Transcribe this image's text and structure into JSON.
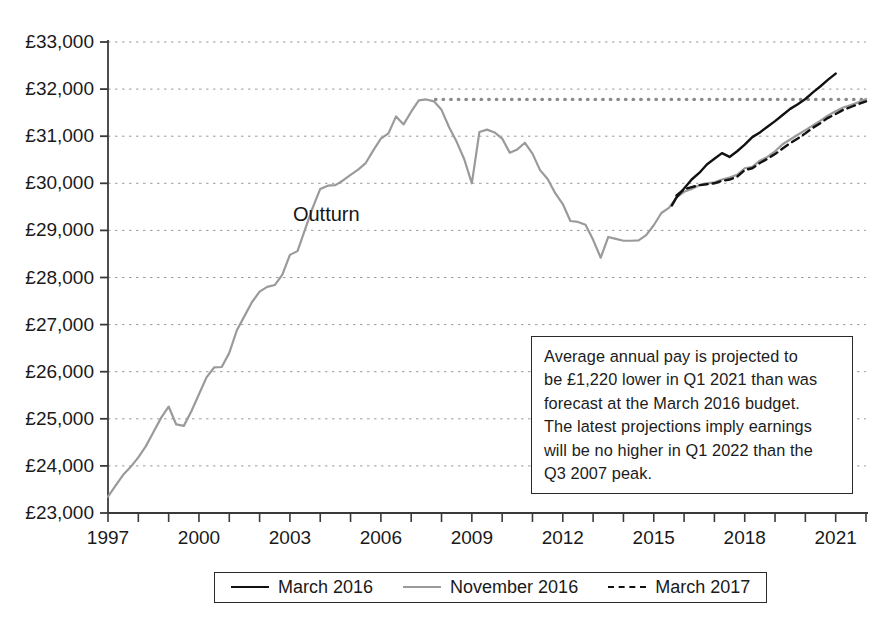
{
  "chart_data": {
    "type": "line",
    "title": "",
    "xlabel": "",
    "ylabel": "",
    "xlim": [
      1997.0,
      2022.0
    ],
    "ylim": [
      23000,
      33000
    ],
    "grid": true,
    "y_tick_labels": [
      "£33,000",
      "£32,000",
      "£31,000",
      "£30,000",
      "£29,000",
      "£28,000",
      "£27,000",
      "£26,000",
      "£25,000",
      "£24,000",
      "£23,000"
    ],
    "y_tick_values": [
      33000,
      32000,
      31000,
      30000,
      29000,
      28000,
      27000,
      26000,
      25000,
      24000,
      23000
    ],
    "x_tick_labels": [
      "1997",
      "2000",
      "2003",
      "2006",
      "2009",
      "2012",
      "2015",
      "2018",
      "2021"
    ],
    "x_tick_values": [
      1997,
      2000,
      2003,
      2006,
      2009,
      2012,
      2015,
      2018,
      2021
    ],
    "x_minor_tick_interval": 1,
    "annotations": [
      {
        "name": "outturn",
        "text": "Outturn",
        "x": 2003.1,
        "y": 29200
      },
      {
        "name": "q3-2007-peak-reference-line",
        "text": "",
        "y": 31780,
        "x_start": 2007.8,
        "x_end": 2022.0,
        "style": "dotted"
      }
    ],
    "legend": {
      "position": "bottom",
      "entries": [
        {
          "label": "March 2016",
          "style": "solid",
          "color": "#111111"
        },
        {
          "label": "November 2016",
          "style": "solid",
          "color": "#9a9a9a"
        },
        {
          "label": "March 2017",
          "style": "dashed",
          "color": "#111111"
        }
      ]
    },
    "series": [
      {
        "name": "November 2016",
        "color": "#9a9a9a",
        "style": "solid",
        "note": "includes outturn history to 2016 then forecast",
        "x": [
          1997.0,
          1997.25,
          1997.5,
          1997.75,
          1998.0,
          1998.25,
          1998.5,
          1998.75,
          1999.0,
          1999.25,
          1999.5,
          1999.75,
          2000.0,
          2000.25,
          2000.5,
          2000.75,
          2001.0,
          2001.25,
          2001.5,
          2001.75,
          2002.0,
          2002.25,
          2002.5,
          2002.75,
          2003.0,
          2003.25,
          2003.5,
          2003.75,
          2004.0,
          2004.25,
          2004.5,
          2004.75,
          2005.0,
          2005.25,
          2005.5,
          2005.75,
          2006.0,
          2006.25,
          2006.5,
          2006.75,
          2007.0,
          2007.25,
          2007.5,
          2007.75,
          2008.0,
          2008.25,
          2008.5,
          2008.75,
          2009.0,
          2009.25,
          2009.5,
          2009.75,
          2010.0,
          2010.25,
          2010.5,
          2010.75,
          2011.0,
          2011.25,
          2011.5,
          2011.75,
          2012.0,
          2012.25,
          2012.5,
          2012.75,
          2013.0,
          2013.25,
          2013.5,
          2013.75,
          2014.0,
          2014.25,
          2014.5,
          2014.75,
          2015.0,
          2015.25,
          2015.5,
          2015.75,
          2016.0,
          2016.25,
          2016.5,
          2016.75,
          2017.0,
          2017.25,
          2017.5,
          2017.75,
          2018.0,
          2018.25,
          2018.5,
          2018.75,
          2019.0,
          2019.25,
          2019.5,
          2019.75,
          2020.0,
          2020.25,
          2020.5,
          2020.75,
          2021.0,
          2021.25,
          2021.5,
          2021.75,
          2022.0
        ],
        "y": [
          23350,
          23580,
          23810,
          23980,
          24180,
          24420,
          24720,
          25020,
          25260,
          24880,
          24850,
          25160,
          25520,
          25880,
          26090,
          26100,
          26400,
          26880,
          27180,
          27480,
          27700,
          27800,
          27840,
          28060,
          28480,
          28560,
          29020,
          29480,
          29880,
          29950,
          29960,
          30060,
          30180,
          30290,
          30430,
          30700,
          30950,
          31060,
          31420,
          31250,
          31520,
          31760,
          31780,
          31740,
          31560,
          31190,
          30880,
          30510,
          30000,
          31090,
          31140,
          31080,
          30950,
          30650,
          30720,
          30860,
          30630,
          30280,
          30090,
          29790,
          29560,
          29200,
          29180,
          29120,
          28800,
          28420,
          28860,
          28820,
          28780,
          28780,
          28790,
          28900,
          29110,
          29370,
          29480,
          29700,
          29820,
          29880,
          29960,
          30000,
          30020,
          30080,
          30120,
          30180,
          30320,
          30350,
          30480,
          30560,
          30680,
          30830,
          30930,
          31030,
          31130,
          31230,
          31330,
          31440,
          31530,
          31610,
          31660,
          31720,
          31790
        ]
      },
      {
        "name": "March 2016",
        "color": "#111111",
        "style": "solid",
        "note": "forecast path, higher trajectory",
        "x": [
          2015.6,
          2015.75,
          2016.0,
          2016.25,
          2016.5,
          2016.75,
          2017.0,
          2017.25,
          2017.5,
          2017.75,
          2018.0,
          2018.25,
          2018.5,
          2018.75,
          2019.0,
          2019.25,
          2019.5,
          2019.75,
          2020.0,
          2020.25,
          2020.5,
          2020.75,
          2021.0
        ],
        "y": [
          29530,
          29700,
          29890,
          30080,
          30220,
          30400,
          30520,
          30640,
          30560,
          30680,
          30820,
          30980,
          31080,
          31200,
          31320,
          31450,
          31580,
          31680,
          31790,
          31930,
          32060,
          32200,
          32330
        ]
      },
      {
        "name": "March 2017",
        "color": "#111111",
        "style": "dashed",
        "note": "forecast path, close to November 2016",
        "x": [
          2015.75,
          2016.0,
          2016.25,
          2016.5,
          2016.75,
          2017.0,
          2017.25,
          2017.5,
          2017.75,
          2018.0,
          2018.25,
          2018.5,
          2018.75,
          2019.0,
          2019.25,
          2019.5,
          2019.75,
          2020.0,
          2020.25,
          2020.5,
          2020.75,
          2021.0,
          2021.25,
          2021.5,
          2021.75,
          2022.0
        ],
        "y": [
          29740,
          29870,
          29920,
          29960,
          29980,
          30000,
          30050,
          30080,
          30140,
          30280,
          30320,
          30430,
          30520,
          30620,
          30740,
          30850,
          30950,
          31060,
          31180,
          31280,
          31390,
          31470,
          31560,
          31620,
          31680,
          31740
        ]
      }
    ]
  },
  "annotation": {
    "name": "projection-callout",
    "lines": [
      "Average annual pay is projected to",
      "be £1,220 lower in Q1 2021 than was",
      "forecast at the March 2016 budget.",
      "The latest projections imply earnings",
      "will be no higher in Q1 2022 than the",
      "Q3 2007 peak."
    ]
  },
  "outturn": {
    "label": "Outturn"
  },
  "legend": {
    "items": [
      {
        "label": "March 2016"
      },
      {
        "label": "November 2016"
      },
      {
        "label": "March 2017"
      }
    ]
  },
  "colors": {
    "march_2016": "#111111",
    "november_2016": "#9a9a9a",
    "march_2017": "#111111",
    "axis": "#3a3a3a",
    "grid": "#9c9c9c",
    "background": "#ffffff"
  }
}
